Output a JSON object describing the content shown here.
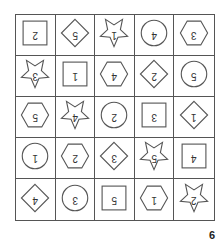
{
  "grid": {
    "rows": 5,
    "cols": 5,
    "orientation": "upside-down",
    "cells": [
      {
        "shape": "square",
        "num": "2"
      },
      {
        "shape": "diamond",
        "num": "5"
      },
      {
        "shape": "star",
        "num": "1"
      },
      {
        "shape": "circle",
        "num": "4"
      },
      {
        "shape": "hexagon",
        "num": "3"
      },
      {
        "shape": "star",
        "num": "3"
      },
      {
        "shape": "square",
        "num": "1"
      },
      {
        "shape": "hexagon",
        "num": "4"
      },
      {
        "shape": "diamond",
        "num": "2"
      },
      {
        "shape": "circle",
        "num": "5"
      },
      {
        "shape": "hexagon",
        "num": "5"
      },
      {
        "shape": "star",
        "num": "4"
      },
      {
        "shape": "circle",
        "num": "2"
      },
      {
        "shape": "square",
        "num": "3"
      },
      {
        "shape": "diamond",
        "num": "1"
      },
      {
        "shape": "circle",
        "num": "1"
      },
      {
        "shape": "hexagon",
        "num": "2"
      },
      {
        "shape": "diamond",
        "num": "3"
      },
      {
        "shape": "star",
        "num": "5"
      },
      {
        "shape": "square",
        "num": "4"
      },
      {
        "shape": "diamond",
        "num": "4"
      },
      {
        "shape": "circle",
        "num": "3"
      },
      {
        "shape": "square",
        "num": "5"
      },
      {
        "shape": "hexagon",
        "num": "1"
      },
      {
        "shape": "star",
        "num": "2"
      }
    ]
  },
  "page_number": "6",
  "colors": {
    "stroke": "#555555",
    "text": "#333333",
    "background": "#ffffff"
  }
}
